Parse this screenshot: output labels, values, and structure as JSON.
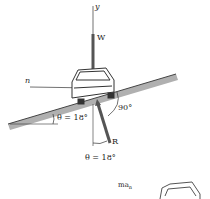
{
  "labels": {
    "y_axis": "y",
    "weight": "W",
    "normal_axis": "n",
    "right_angle": "90°",
    "slope_angle": "θ = 18°",
    "reaction": "R",
    "reaction_angle": "θ = 18°",
    "inertial_force": "ma",
    "inertial_sub": "n"
  },
  "colors": {
    "ground": "#a8a8a8",
    "vector": "#555555",
    "line": "#333333"
  }
}
